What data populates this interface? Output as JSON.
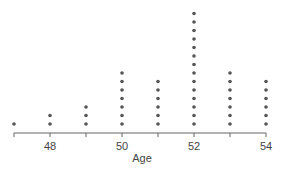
{
  "chart_data": {
    "type": "dot",
    "title": "",
    "xlabel": "Age",
    "ylabel": "",
    "x": [
      47,
      48,
      49,
      50,
      51,
      52,
      53,
      54
    ],
    "counts": [
      1,
      2,
      3,
      7,
      6,
      14,
      7,
      6
    ],
    "xlim": [
      47,
      54
    ],
    "xticks": [
      47,
      48,
      49,
      50,
      51,
      52,
      53,
      54
    ],
    "xtick_labels": [
      "",
      "48",
      "",
      "50",
      "",
      "52",
      "",
      "54"
    ],
    "grid": false,
    "legend": null
  },
  "colors": {
    "dot": "#555555",
    "axis": "#666666",
    "text": "#444444"
  }
}
